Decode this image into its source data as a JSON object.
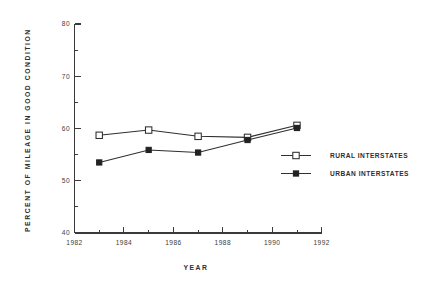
{
  "chart_data": {
    "type": "line",
    "title": "",
    "xlabel": "YEAR",
    "ylabel": "PERCENT OF MILEAGE IN GOOD CONDITION",
    "x": [
      1983,
      1985,
      1987,
      1989,
      1991
    ],
    "xlim": [
      1982,
      1992
    ],
    "ylim": [
      40,
      80
    ],
    "x_ticks_major": [
      1982,
      1984,
      1986,
      1988,
      1990,
      1992
    ],
    "x_ticks_major_labels": [
      "1982",
      "1984",
      "1986",
      "1988",
      "1990",
      "1992"
    ],
    "x_ticks_minor": [
      1983,
      1985,
      1987,
      1989,
      1991
    ],
    "y_ticks_major": [
      40,
      50,
      60,
      70,
      80
    ],
    "y_ticks_major_labels": [
      "40",
      "50",
      "60",
      "70",
      "80"
    ],
    "y_ticks_minor": [
      45,
      55,
      65,
      75
    ],
    "grid": false,
    "legend_position": "center-right",
    "series": [
      {
        "name": "RURAL INTERSTATES",
        "marker": "open-square",
        "values": [
          58.7,
          59.7,
          58.5,
          58.3,
          60.6
        ]
      },
      {
        "name": "URBAN INTERSTATES",
        "marker": "filled-square",
        "values": [
          53.5,
          55.9,
          55.4,
          57.8,
          60.1
        ]
      }
    ]
  },
  "legend": {
    "items": [
      {
        "label": "RURAL INTERSTATES"
      },
      {
        "label": "URBAN INTERSTATES"
      }
    ]
  },
  "colors": {
    "line": "#2e2e2e",
    "axis": "#3a3a3a",
    "text": "#2f2f2f",
    "background": "#ffffff"
  }
}
